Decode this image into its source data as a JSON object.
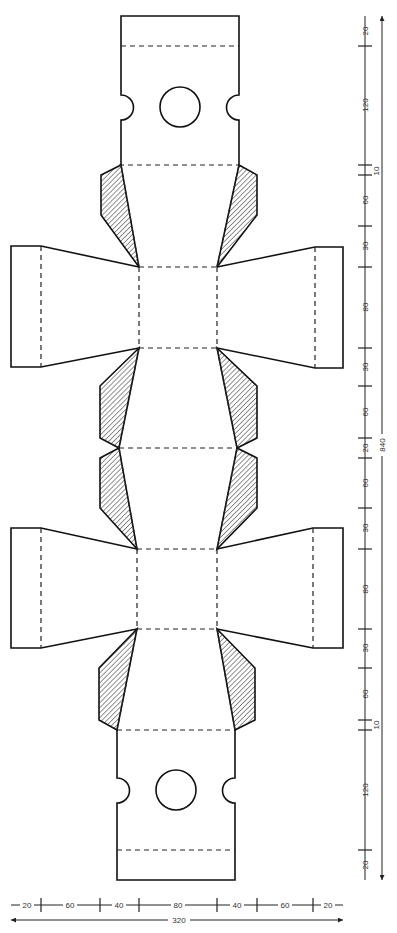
{
  "diagram": {
    "type": "box-template-net",
    "legend": {
      "cut_line": "solid",
      "fold_line": "dashed",
      "glue_flap": "hatched"
    },
    "colors": {
      "line": "#111111",
      "hatch": "#555555",
      "background": "#ffffff"
    }
  },
  "dimensions": {
    "vertical": {
      "segments": [
        "20",
        "120",
        "10",
        "60",
        "30",
        "80",
        "30",
        "60",
        "20",
        "60",
        "30",
        "80",
        "30",
        "60",
        "10",
        "120",
        "20"
      ],
      "total": "840"
    },
    "horizontal": {
      "segments": [
        "20",
        "60",
        "40",
        "80",
        "40",
        "60",
        "20"
      ],
      "total": "320"
    }
  }
}
